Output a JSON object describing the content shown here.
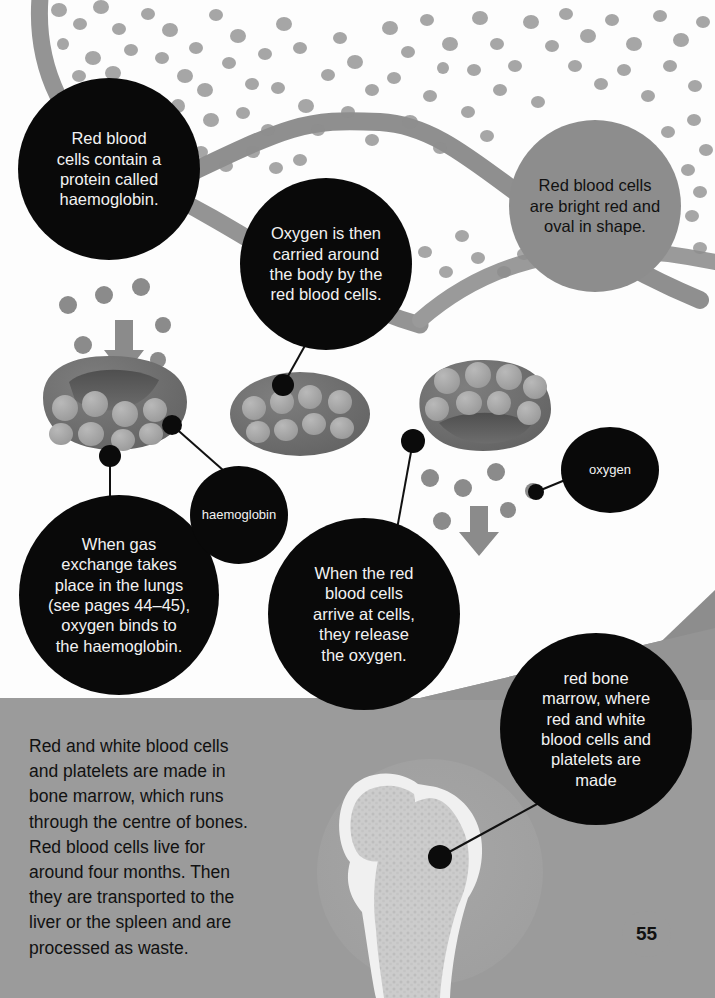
{
  "page": {
    "number": "55",
    "topic": "red blood cells and bone marrow"
  },
  "palette": {
    "bubble_dark": "#090909",
    "bubble_dark_text": "#f2f2f2",
    "bubble_grey": "#8d8d8d",
    "bubble_grey_text": "#111111",
    "background": "#fdfdfd",
    "floor_grey": "#9b9b9b",
    "wedge_grey": "#8d8d8d",
    "cell_body": "#6f6f6f",
    "cell_dot": "#a6a6a6",
    "vessel_band": "#8f8f8f",
    "scatter_cell": "#8b8b8b",
    "bone_outline": "#f0f0f0",
    "bone_marrow": "#c9c9c9",
    "bone_backdrop": "#a9a9a9"
  },
  "callouts": {
    "haemoglobin_protein": {
      "text": "Red blood\ncells contain a\nprotein called\nhaemoglobin.",
      "style": "dark"
    },
    "oxygen_carried": {
      "text": "Oxygen is then\ncarried around\nthe body by the\nred blood cells.",
      "style": "dark"
    },
    "bright_red": {
      "text": "Red blood cells\nare bright red and\noval in shape.",
      "style": "grey"
    },
    "gas_exchange": {
      "text": "When gas\nexchange takes\nplace in the lungs\n(see pages 44–45),\noxygen binds to\nthe haemoglobin.",
      "style": "dark"
    },
    "release_oxygen": {
      "text": "When the red\nblood cells\narrive at cells,\nthey release\nthe oxygen.",
      "style": "dark"
    },
    "red_bone_marrow": {
      "text": "red bone\nmarrow, where\nred and white\nblood cells and\nplatelets are\nmade",
      "style": "dark"
    },
    "haemoglobin_label": {
      "text": "haemoglobin",
      "style": "dark"
    },
    "oxygen_label": {
      "text": "oxygen",
      "style": "dark"
    }
  },
  "body_text": {
    "paragraph": "Red and white blood cells\nand platelets are made in\nbone marrow, which runs\nthrough the centre of bones.\nRed blood cells live for\naround four months. Then\nthey are transported to the\nliver or the spleen and are\nprocessed as waste."
  },
  "illustration": {
    "red_blood_cells": [
      {
        "name": "cell-left-concave",
        "cx": 115,
        "cy": 404
      },
      {
        "name": "cell-middle-flat",
        "cx": 300,
        "cy": 414
      },
      {
        "name": "cell-right-concave",
        "cx": 485,
        "cy": 407
      }
    ],
    "arrows": [
      {
        "name": "oxygen-arrow-down-left",
        "x": 122,
        "y": 318
      },
      {
        "name": "oxygen-arrow-down-right",
        "x": 478,
        "y": 518
      }
    ],
    "bone": {
      "name": "femur-cross-section",
      "label": "red bone marrow"
    },
    "vessel_bands": 2,
    "leader_lines": 6
  }
}
